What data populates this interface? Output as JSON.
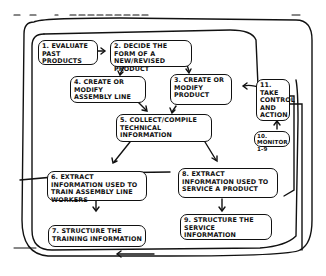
{
  "diagram": {
    "type": "hand-drawn flowchart",
    "nodes": [
      {
        "id": "1",
        "label": "1. Evaluate past products"
      },
      {
        "id": "2",
        "label": "2. Decide the form of a new/revised product"
      },
      {
        "id": "3",
        "label": "3. Create or modify product"
      },
      {
        "id": "4",
        "label": "4. Create or modify assembly line"
      },
      {
        "id": "5",
        "label": "5. Collect/compile technical information"
      },
      {
        "id": "6",
        "label": "6. Extract information used to train assembly line workers"
      },
      {
        "id": "7",
        "label": "7. Structure the training information"
      },
      {
        "id": "8",
        "label": "8. Extract information used to service a product"
      },
      {
        "id": "9",
        "label": "9. Structure the service information"
      },
      {
        "id": "10",
        "label": "10. Monitor 1-9"
      },
      {
        "id": "11",
        "label": "11. Take control and action"
      }
    ],
    "edges": [
      {
        "from": "1",
        "to": "2"
      },
      {
        "from": "2",
        "to": "4"
      },
      {
        "from": "2",
        "to": "3"
      },
      {
        "from": "4",
        "to": "5"
      },
      {
        "from": "3",
        "to": "5"
      },
      {
        "from": "5",
        "to": "6"
      },
      {
        "from": "5",
        "to": "8"
      },
      {
        "from": "6",
        "to": "7"
      },
      {
        "from": "8",
        "to": "9"
      },
      {
        "from": "10",
        "to": "11"
      },
      {
        "from": "11",
        "to": "2"
      },
      {
        "from": "11",
        "to": "8"
      },
      {
        "from": "11",
        "to": "7"
      }
    ]
  }
}
